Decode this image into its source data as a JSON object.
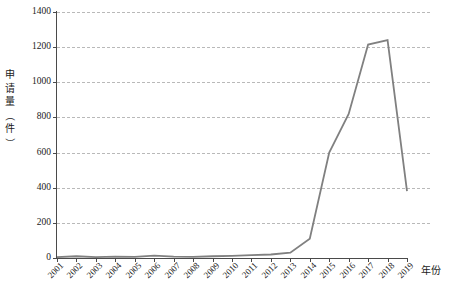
{
  "chart_data": {
    "type": "line",
    "title": "",
    "xlabel": "年份",
    "ylabel": "申请量（件）",
    "ylim": [
      0,
      1400
    ],
    "ytick_step": 200,
    "yticks": [
      "0",
      "200",
      "400",
      "600",
      "800",
      "1000",
      "1200",
      "1400"
    ],
    "grid": true,
    "legend": "none",
    "line_color": "#808080",
    "categories": [
      "2001",
      "2002",
      "2003",
      "2004",
      "2005",
      "2006",
      "2007",
      "2008",
      "2009",
      "2010",
      "2011",
      "2012",
      "2013",
      "2014",
      "2015",
      "2016",
      "2017",
      "2018",
      "2019"
    ],
    "values": [
      5,
      10,
      5,
      8,
      6,
      14,
      8,
      6,
      10,
      12,
      16,
      20,
      30,
      110,
      600,
      820,
      1215,
      1240,
      380
    ],
    "series": [
      {
        "name": "申请量",
        "values": [
          5,
          10,
          5,
          8,
          6,
          14,
          8,
          6,
          10,
          12,
          16,
          20,
          30,
          110,
          600,
          820,
          1215,
          1240,
          380
        ]
      }
    ]
  },
  "axis": {
    "y_title_chars": [
      "申",
      "请",
      "量",
      "（",
      "件",
      "）"
    ],
    "x_title": "年份"
  },
  "caption": ""
}
